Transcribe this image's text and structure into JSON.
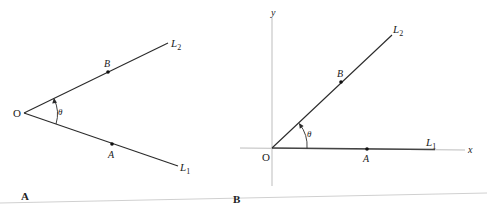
{
  "figure": {
    "panels": [
      {
        "id": "A",
        "panel_label": "A",
        "origin_label": "O",
        "line1_label": "L",
        "line1_sub": "1",
        "line2_label": "L",
        "line2_sub": "2",
        "point_on_l1": "A",
        "point_on_l2": "B",
        "angle_label": "θ",
        "has_axes": false
      },
      {
        "id": "B",
        "panel_label": "B",
        "origin_label": "O",
        "x_axis_label": "x",
        "y_axis_label": "y",
        "line1_label": "L",
        "line1_sub": "1",
        "line2_label": "L",
        "line2_sub": "2",
        "point_on_l1": "A",
        "point_on_l2": "B",
        "angle_label": "θ",
        "has_axes": true
      }
    ],
    "colors": {
      "line": "#2a2a2a",
      "axis": "#bdbdbd",
      "separator": "#cfcfcf",
      "text": "#222222"
    }
  }
}
